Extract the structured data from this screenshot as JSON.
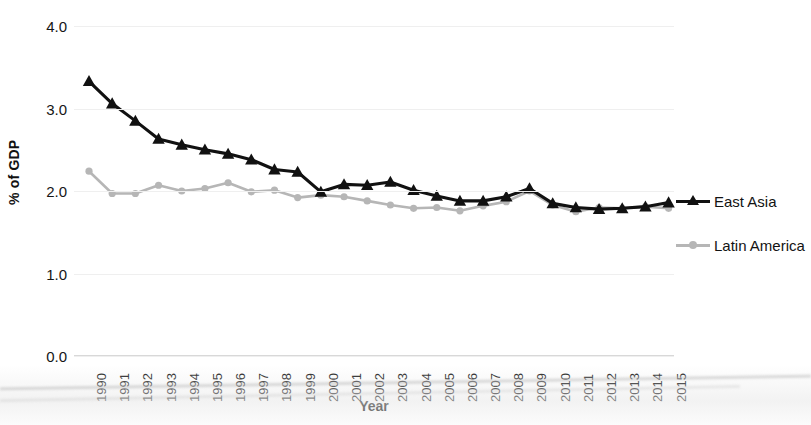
{
  "chart_data": {
    "type": "line",
    "title": "",
    "xlabel": "Year",
    "ylabel": "% of GDP",
    "ylim": [
      0.0,
      4.0
    ],
    "ytick_labels": [
      "4.0",
      "3.0",
      "2.0",
      "1.0",
      "0.0"
    ],
    "ytick_values": [
      4.0,
      3.0,
      2.0,
      1.0,
      0.0
    ],
    "grid": true,
    "legend_position": "right",
    "categories": [
      "1990",
      "1991",
      "1992",
      "1993",
      "1994",
      "1995",
      "1996",
      "1997",
      "1998",
      "1999",
      "2000",
      "2001",
      "2002",
      "2003",
      "2004",
      "2005",
      "2006",
      "2007",
      "2008",
      "2009",
      "2010",
      "2011",
      "2012",
      "2013",
      "2014",
      "2015"
    ],
    "x": [
      1990,
      1991,
      1992,
      1993,
      1994,
      1995,
      1996,
      1997,
      1998,
      1999,
      2000,
      2001,
      2002,
      2003,
      2004,
      2005,
      2006,
      2007,
      2008,
      2009,
      2010,
      2011,
      2012,
      2013,
      2014,
      2015
    ],
    "series": [
      {
        "name": "East Asia",
        "color": "#111111",
        "marker": "triangle",
        "values": [
          3.33,
          3.06,
          2.85,
          2.63,
          2.56,
          2.5,
          2.45,
          2.38,
          2.26,
          2.23,
          1.99,
          2.08,
          2.07,
          2.11,
          2.01,
          1.94,
          1.88,
          1.88,
          1.93,
          2.03,
          1.85,
          1.8,
          1.78,
          1.79,
          1.81,
          1.86
        ]
      },
      {
        "name": "Latin America",
        "color": "#b6b6b6",
        "marker": "circle",
        "values": [
          2.24,
          1.97,
          1.97,
          2.07,
          2.0,
          2.03,
          2.1,
          1.99,
          2.01,
          1.92,
          1.95,
          1.93,
          1.88,
          1.83,
          1.79,
          1.8,
          1.76,
          1.82,
          1.87,
          2.0,
          1.83,
          1.75,
          1.8,
          1.79,
          1.81,
          1.79
        ]
      }
    ]
  },
  "legend": {
    "items": [
      {
        "label": "East Asia"
      },
      {
        "label": "Latin America"
      }
    ]
  }
}
